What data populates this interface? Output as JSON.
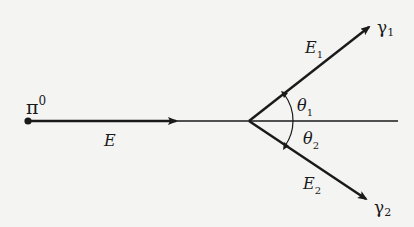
{
  "diagram": {
    "particle": {
      "symbol": "π",
      "superscript": "0"
    },
    "incoming_energy": {
      "label": "E"
    },
    "photons": [
      {
        "symbol": "γ",
        "subscript": "1",
        "energy_label": "E",
        "energy_subscript": "1",
        "angle_label": "θ",
        "angle_subscript": "1"
      },
      {
        "symbol": "γ",
        "subscript": "2",
        "energy_label": "E",
        "energy_subscript": "2",
        "angle_label": "θ",
        "angle_subscript": "2"
      }
    ],
    "colors": {
      "ink": "#1a1a1a",
      "background": "#f4f4f2"
    }
  }
}
